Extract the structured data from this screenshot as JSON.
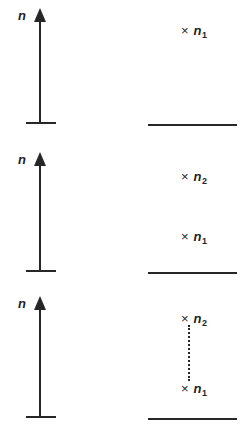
{
  "figure": {
    "background_color": "#ffffff",
    "ink_color": "#262626",
    "width": 250,
    "height": 439
  },
  "axis": {
    "label": "n",
    "arrow_direction": "up"
  },
  "symbols": {
    "cross": "×",
    "n": "n",
    "sub1": "1",
    "sub2": "2"
  },
  "panels": [
    {
      "id": "panel-top",
      "axis_label": "n",
      "top": 0,
      "height": 131,
      "axis": {
        "tip_y": 8,
        "base_y": 122,
        "label_x": 18,
        "label_y": 9
      },
      "baseline_y": 124,
      "states": [
        {
          "name": "n1",
          "cross": "×",
          "symbol": "n",
          "subscript": "1",
          "x": 181,
          "y": 24
        }
      ],
      "transition": null
    },
    {
      "id": "panel-middle",
      "axis_label": "n",
      "top": 131,
      "height": 148,
      "axis": {
        "tip_y": 152,
        "base_y": 270,
        "label_x": 18,
        "label_y": 153
      },
      "baseline_y": 272,
      "states": [
        {
          "name": "n2",
          "cross": "×",
          "symbol": "n",
          "subscript": "2",
          "x": 181,
          "y": 170
        },
        {
          "name": "n1",
          "cross": "×",
          "symbol": "n",
          "subscript": "1",
          "x": 181,
          "y": 230
        }
      ],
      "transition": null
    },
    {
      "id": "panel-bottom",
      "axis_label": "n",
      "top": 279,
      "height": 160,
      "axis": {
        "tip_y": 296,
        "base_y": 416,
        "label_x": 18,
        "label_y": 297
      },
      "baseline_y": 418,
      "states": [
        {
          "name": "n2",
          "cross": "×",
          "symbol": "n",
          "subscript": "2",
          "x": 181,
          "y": 312
        },
        {
          "name": "n1",
          "cross": "×",
          "symbol": "n",
          "subscript": "1",
          "x": 181,
          "y": 382
        }
      ],
      "transition": {
        "x": 188,
        "y_top": 325,
        "y_bottom": 381
      }
    }
  ]
}
